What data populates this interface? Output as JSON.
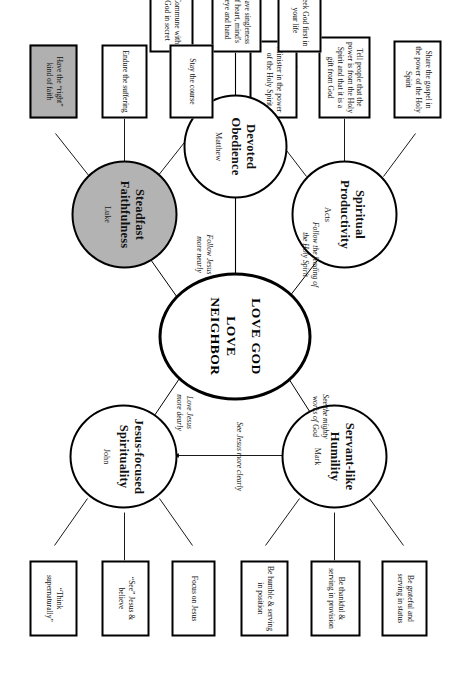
{
  "diagram": {
    "center": {
      "line1": "LOVE GOD",
      "line2": "LOVE NEIGHBOR"
    },
    "branches": [
      {
        "id": "spiritual-productivity",
        "title": "Spiritual Productivity",
        "gospel": "Acts",
        "shaded": false,
        "edge_label": "Follow the leading of\nthe Holy Spirit",
        "boxes": [
          {
            "text": "Share the gospel in the power of the Holy Spirit",
            "shaded": false
          },
          {
            "text": "Tell people that the power is from the Holy Spirit and that it is a gift from God",
            "shaded": false
          },
          {
            "text": "Minister in the power of the Holy Spirit",
            "shaded": false
          }
        ]
      },
      {
        "id": "servant-like-humility",
        "title": "Servant-like Humility",
        "gospel": "Mark",
        "shaded": false,
        "edge_label": "See the mighty\nworks of God",
        "boxes": [
          {
            "text": "Be grateful and serving in status",
            "shaded": false
          },
          {
            "text": "Be thankful & serving in provision",
            "shaded": false
          },
          {
            "text": "Be humble & serving in position",
            "shaded": false
          }
        ]
      },
      {
        "id": "devoted-obedience",
        "title": "Devoted Obedience",
        "gospel": "Matthew",
        "shaded": false,
        "edge_label": "",
        "boxes": [
          {
            "text": "Seek God first in your life",
            "shaded": false
          },
          {
            "text": "Have singleness of heart, mind's eye and hand",
            "shaded": false
          },
          {
            "text": "Commune with God in secret",
            "shaded": false
          }
        ]
      },
      {
        "id": "steadfast-faithfulness",
        "title": "Steadfast Faithfulness",
        "gospel": "Luke",
        "shaded": true,
        "edge_label": "Follow Jesus\nmore nearly",
        "boxes": [
          {
            "text": "Stay the course",
            "shaded": false
          },
          {
            "text": "Endure the suffering",
            "shaded": false
          },
          {
            "text": "Have the “right” kind of faith",
            "shaded": true
          }
        ]
      },
      {
        "id": "jesus-focused-spirituality",
        "title": "Jesus-focused Spirituality",
        "gospel": "John",
        "shaded": false,
        "edge_label": "Love Jesus\nmore dearly",
        "boxes": [
          {
            "text": "Focus on Jesus",
            "shaded": false
          },
          {
            "text": "“See” Jesus & believe",
            "shaded": false
          },
          {
            "text": "“Think supernaturally”",
            "shaded": false
          }
        ]
      }
    ],
    "extra_edge_labels": [
      {
        "id": "see-jesus-more-clearly",
        "text": "See Jesus more clearly"
      }
    ],
    "colors": {
      "stroke": "#000000",
      "shade_fill": "#b3b3b3",
      "background": "#ffffff"
    }
  }
}
